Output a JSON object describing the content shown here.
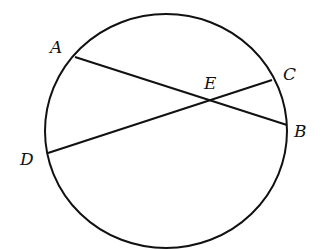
{
  "diagram": {
    "type": "circle-with-intersecting-chords",
    "circle": {
      "cx": 166,
      "cy": 131,
      "rx": 121,
      "ry": 117,
      "stroke": "#111111"
    },
    "points": {
      "A": {
        "x": 75,
        "y": 57,
        "label": "A",
        "lx": 50,
        "ly": 53
      },
      "B": {
        "x": 287,
        "y": 125,
        "label": "B",
        "lx": 294,
        "ly": 137
      },
      "C": {
        "x": 272,
        "y": 80,
        "label": "C",
        "lx": 283,
        "ly": 80
      },
      "D": {
        "x": 48,
        "y": 153,
        "label": "D",
        "lx": 20,
        "ly": 165
      },
      "E": {
        "x": 209,
        "y": 100,
        "label": "E",
        "lx": 204,
        "ly": 89
      }
    },
    "chords": [
      {
        "from": "A",
        "to": "B"
      },
      {
        "from": "D",
        "to": "C"
      }
    ]
  }
}
